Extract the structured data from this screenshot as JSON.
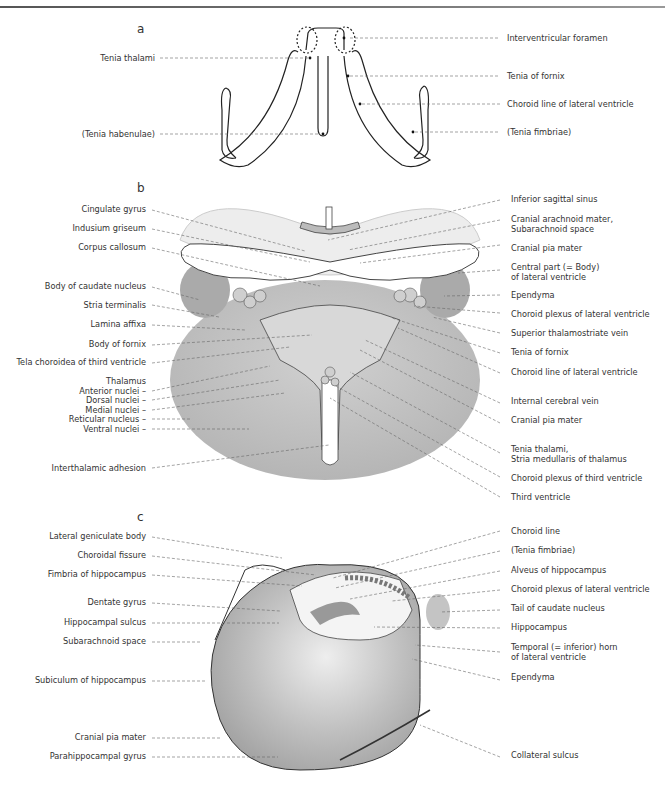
{
  "figure": {
    "panels": [
      {
        "id": "a",
        "letter": "a",
        "left_labels": [
          "Tenia thalami",
          "(Tenia habenulae)"
        ],
        "right_labels": [
          "Interventricular foramen",
          "Tenia of fornix",
          "Choroid line of lateral ventricle",
          "(Tenia fimbriae)"
        ]
      },
      {
        "id": "b",
        "letter": "b",
        "left_labels": [
          "Cingulate gyrus",
          "Indusium griseum",
          "Corpus callosum",
          "Body of caudate nucleus",
          "Stria terminalis",
          "Lamina affixa",
          "Body of fornix",
          "Tela choroidea of third ventricle",
          "Thalamus",
          "Anterior nuclei –",
          "Dorsal nuclei –",
          "Medial nuclei –",
          "Reticular nucleus –",
          "Ventral nuclei –",
          "Interthalamic adhesion"
        ],
        "right_labels": [
          "Inferior sagittal sinus",
          "Cranial arachnoid mater,",
          "Subarachnoid space",
          "Cranial pia mater",
          "Central part (= Body)",
          "of lateral ventricle",
          "Ependyma",
          "Choroid plexus of lateral ventricle",
          "Superior thalamostriate vein",
          "Tenia of fornix",
          "Choroid line of lateral ventricle",
          "Internal cerebral vein",
          "Cranial pia mater",
          "Tenia thalami,",
          "Stria medullaris of thalamus",
          "Choroid plexus of third ventricle",
          "Third ventricle"
        ]
      },
      {
        "id": "c",
        "letter": "c",
        "left_labels": [
          "Lateral geniculate body",
          "Choroidal fissure",
          "Fimbria of hippocampus",
          "Dentate gyrus",
          "Hippocampal sulcus",
          "Subarachnoid space",
          "Subiculum of hippocampus",
          "Cranial pia mater",
          "Parahippocampal gyrus"
        ],
        "right_labels": [
          "Choroid line",
          "(Tenia fimbriae)",
          "Alveus of hippocampus",
          "Choroid plexus of lateral ventricle",
          "Tail of caudate nucleus",
          "Hippocampus",
          "Temporal (= inferior) horn",
          "of lateral ventricle",
          "Ependyma",
          "Collateral sulcus"
        ]
      }
    ],
    "colors": {
      "ink": "#333333",
      "tissue_dark": "#9a9a9a",
      "tissue_mid": "#c4c4c4",
      "tissue_light": "#e2e2e2",
      "leader": "#666666"
    }
  }
}
